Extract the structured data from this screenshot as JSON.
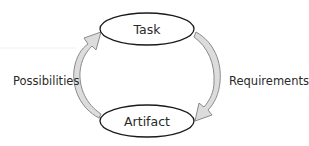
{
  "diagram": {
    "type": "cycle",
    "nodes": [
      {
        "id": "task",
        "label": "Task"
      },
      {
        "id": "artifact",
        "label": "Artifact"
      }
    ],
    "edges": [
      {
        "from": "task",
        "to": "artifact",
        "label": "Requirements"
      },
      {
        "from": "artifact",
        "to": "task",
        "label": "Possibilities"
      }
    ],
    "colors": {
      "node_stroke": "#1a1a1a",
      "node_fill": "#ffffff",
      "arrow_fill": "#dcdcdc",
      "arrow_stroke": "#8a8a8a",
      "text": "#2a2a2a"
    }
  }
}
